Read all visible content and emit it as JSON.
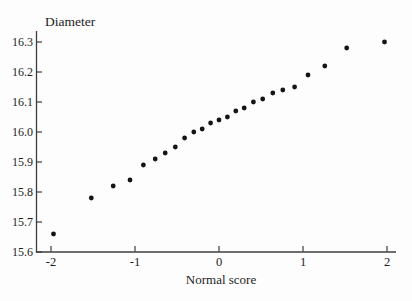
{
  "page": {
    "background": "#fdfdfd",
    "axis_color": "#3c3c3c",
    "text_color": "#1c1c1c",
    "marker_color": "#141414"
  },
  "chart_data": {
    "type": "scatter",
    "title": "",
    "ylabel": "Diameter",
    "xlabel": "Normal score",
    "xlim": [
      -2.2,
      2.1
    ],
    "ylim": [
      15.6,
      16.35
    ],
    "grid": false,
    "legend": "none",
    "x_ticks": [
      -2,
      -1,
      0,
      1,
      2
    ],
    "x_tick_labels": [
      "-2",
      "-1",
      "0",
      "1",
      "2"
    ],
    "y_ticks": [
      16.3,
      16.2,
      16.1,
      16.0,
      15.9,
      15.8,
      15.7,
      15.6
    ],
    "y_tick_labels": [
      "16.3",
      "16.2",
      "16.1",
      "16.0",
      "15.9",
      "15.8",
      "15.7",
      "15.6"
    ],
    "points": [
      {
        "x": -1.97,
        "y": 15.66
      },
      {
        "x": -1.52,
        "y": 15.78
      },
      {
        "x": -1.26,
        "y": 15.82
      },
      {
        "x": -1.06,
        "y": 15.84
      },
      {
        "x": -0.9,
        "y": 15.89
      },
      {
        "x": -0.76,
        "y": 15.91
      },
      {
        "x": -0.64,
        "y": 15.93
      },
      {
        "x": -0.52,
        "y": 15.95
      },
      {
        "x": -0.41,
        "y": 15.98
      },
      {
        "x": -0.3,
        "y": 16.0
      },
      {
        "x": -0.2,
        "y": 16.01
      },
      {
        "x": -0.1,
        "y": 16.03
      },
      {
        "x": 0.0,
        "y": 16.04
      },
      {
        "x": 0.1,
        "y": 16.05
      },
      {
        "x": 0.2,
        "y": 16.07
      },
      {
        "x": 0.3,
        "y": 16.08
      },
      {
        "x": 0.41,
        "y": 16.1
      },
      {
        "x": 0.52,
        "y": 16.11
      },
      {
        "x": 0.64,
        "y": 16.13
      },
      {
        "x": 0.76,
        "y": 16.14
      },
      {
        "x": 0.9,
        "y": 16.15
      },
      {
        "x": 1.06,
        "y": 16.19
      },
      {
        "x": 1.26,
        "y": 16.22
      },
      {
        "x": 1.52,
        "y": 16.28
      },
      {
        "x": 1.97,
        "y": 16.3
      }
    ]
  }
}
